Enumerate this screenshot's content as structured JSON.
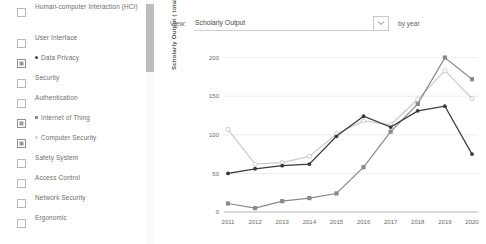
{
  "facets": {
    "items": [
      {
        "label": "Human-computer Interaction (HCI)",
        "checked": false,
        "marker": "none"
      },
      {
        "label": "User Interface",
        "checked": false,
        "marker": "none"
      },
      {
        "label": "Data Privacy",
        "checked": true,
        "marker": "dot",
        "color": "#444444"
      },
      {
        "label": "Security",
        "checked": false,
        "marker": "none"
      },
      {
        "label": "Authentication",
        "checked": false,
        "marker": "none"
      },
      {
        "label": "Internet of Thing",
        "checked": true,
        "marker": "square",
        "color": "#8a8a8a"
      },
      {
        "label": "Computer Security",
        "checked": true,
        "marker": "circle",
        "color": "#c9c9c9"
      },
      {
        "label": "Safety System",
        "checked": false,
        "marker": "none"
      },
      {
        "label": "Access Control",
        "checked": false,
        "marker": "none"
      },
      {
        "label": "Network Security",
        "checked": false,
        "marker": "none"
      },
      {
        "label": "Ergonomic",
        "checked": false,
        "marker": "none"
      }
    ]
  },
  "toolbar": {
    "view_label": "View:",
    "view_value": "Scholarly Output",
    "by_label": "by year",
    "dropdown_icon": "chevron-down-icon"
  },
  "chart_data": {
    "type": "line",
    "title": "",
    "xlabel": "",
    "ylabel": "Scholarly Output ( total value )",
    "categories": [
      "2011",
      "2012",
      "2013",
      "2014",
      "2015",
      "2016",
      "2017",
      "2018",
      "2019",
      "2020"
    ],
    "x": [
      2011,
      2012,
      2013,
      2014,
      2015,
      2016,
      2017,
      2018,
      2019,
      2020
    ],
    "ylim": [
      0,
      215
    ],
    "yticks": [
      0,
      50,
      100,
      150,
      200
    ],
    "ytick_labels": [
      "0",
      "50",
      "100",
      "150",
      "200"
    ],
    "grid": true,
    "legend_position": "none",
    "series": [
      {
        "name": "Data Privacy",
        "color": "#3a3a3a",
        "marker": "dot",
        "values": [
          50,
          56,
          60,
          62,
          98,
          124,
          110,
          131,
          137,
          75
        ]
      },
      {
        "name": "Internet of Thing",
        "color": "#8a8a8a",
        "marker": "square",
        "values": [
          11,
          5,
          14,
          18,
          24,
          58,
          104,
          140,
          200,
          172
        ]
      },
      {
        "name": "Computer Security",
        "color": "#cccccc",
        "marker": "circle",
        "values": [
          107,
          62,
          64,
          72,
          101,
          118,
          113,
          146,
          183,
          147
        ]
      }
    ]
  }
}
